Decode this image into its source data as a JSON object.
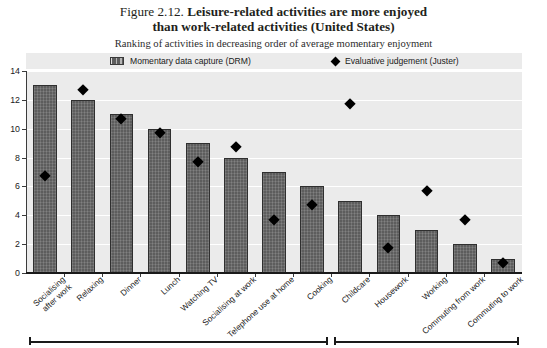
{
  "figure": {
    "number": "Figure 2.12.",
    "title_line1": "Leisure-related activities are more enjoyed",
    "title_line2": "than work-related activities (United States)",
    "subtitle": "Ranking of activities in decreasing order of average momentary enjoyment"
  },
  "legend": {
    "series1_label": "Momentary data capture (DRM)",
    "series2_label": "Evaluative judgement (Juster)",
    "bar_icon": "bar-swatch-icon",
    "diamond_icon": "diamond-swatch-icon"
  },
  "colors": {
    "bar_fill": "#5d5d5d",
    "bar_stroke": "#2f2f2f",
    "marker": "#000000",
    "plot_background": "#ebebeb",
    "gridline": "#ffffff",
    "axis": "#1a1a1a"
  },
  "chart_data": {
    "type": "bar",
    "title": "Figure 2.12. Leisure-related activities are more enjoyed than work-related activities (United States)",
    "subtitle": "Ranking of activities in decreasing order of average momentary enjoyment",
    "xlabel": "",
    "ylabel": "",
    "ylim": [
      0,
      14
    ],
    "yticks": [
      0,
      2,
      4,
      6,
      8,
      10,
      12,
      14
    ],
    "ytick_labels": [
      "0",
      "2",
      "4",
      "6",
      "8",
      "10",
      "12",
      "14"
    ],
    "grid": true,
    "legend_position": "top",
    "categories": [
      "Socialising after work",
      "Relaxing",
      "Dinner",
      "Lunch",
      "Watching TV",
      "Socialising at work",
      "Telephone use at home",
      "Cooking",
      "Childcare",
      "Housework",
      "Working",
      "Commuting from work",
      "Commuting to work"
    ],
    "series": [
      {
        "name": "Momentary data capture (DRM)",
        "type": "bar",
        "values": [
          13,
          12,
          11,
          10,
          9,
          8,
          7,
          6,
          5,
          4,
          3,
          2,
          1
        ]
      },
      {
        "name": "Evaluative judgement (Juster)",
        "type": "scatter",
        "values": [
          7,
          13,
          11,
          10,
          8,
          9,
          4,
          5,
          12,
          2,
          6,
          4,
          1
        ]
      }
    ],
    "annotations": [
      {
        "name": "leisure-group-bracket",
        "from_category": "Socialising after work",
        "to_category": "Cooking"
      },
      {
        "name": "work-group-bracket",
        "from_category": "Childcare",
        "to_category": "Commuting to work"
      }
    ]
  }
}
